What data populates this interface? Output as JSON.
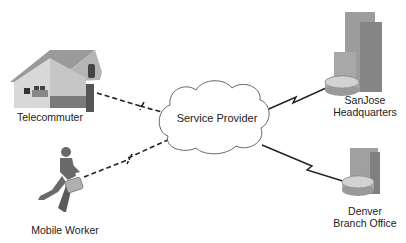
{
  "diagram": {
    "cloud": {
      "label": "Service Provider"
    },
    "nodes": [
      {
        "id": "telecommuter",
        "label": "Telecommuter",
        "icon": "house-icon",
        "link": "dashed"
      },
      {
        "id": "mobile-worker",
        "label": "Mobile Worker",
        "icon": "running-person-icon",
        "link": "dashed"
      },
      {
        "id": "sanjose",
        "label_line1": "SanJose",
        "label_line2": "Headquarters",
        "icon": "building-router-icon",
        "link": "serial"
      },
      {
        "id": "denver",
        "label_line1": "Denver",
        "label_line2": "Branch Office",
        "icon": "building-router-icon",
        "link": "serial"
      }
    ],
    "colors": {
      "line": "#222222",
      "icon_gray": "#8a8a8a",
      "cloud_stroke": "#555555"
    }
  }
}
